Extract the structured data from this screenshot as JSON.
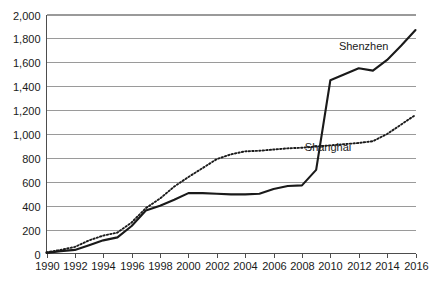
{
  "chart_data": {
    "type": "line",
    "title": "",
    "xlabel": "",
    "ylabel": "",
    "xlim": [
      1990,
      2016
    ],
    "ylim": [
      0,
      2000
    ],
    "grid": true,
    "legend_position": "inline-annotations",
    "x": [
      1990,
      1991,
      1992,
      1993,
      1994,
      1995,
      1996,
      1997,
      1998,
      1999,
      2000,
      2001,
      2002,
      2003,
      2004,
      2005,
      2006,
      2007,
      2008,
      2009,
      2010,
      2011,
      2012,
      2013,
      2014,
      2015,
      2016
    ],
    "xticks": [
      "1990",
      "1992",
      "1994",
      "1996",
      "1998",
      "2000",
      "2002",
      "2004",
      "2006",
      "2008",
      "2010",
      "2012",
      "2014",
      "2016"
    ],
    "yticks": [
      "0",
      "200",
      "400",
      "600",
      "800",
      "1,000",
      "1,200",
      "1,400",
      "1,600",
      "1,800",
      "2,000"
    ],
    "series": [
      {
        "name": "Shenzhen",
        "style": "solid",
        "color": "#1a1a1a",
        "label": "Shenzhen",
        "values": [
          5,
          20,
          30,
          70,
          110,
          135,
          230,
          360,
          400,
          450,
          505,
          505,
          500,
          495,
          495,
          500,
          540,
          565,
          570,
          700,
          1450,
          1500,
          1550,
          1530,
          1620,
          1740,
          1870
        ]
      },
      {
        "name": "Shanghai",
        "style": "dotted",
        "color": "#1a1a1a",
        "label": "Shanghai",
        "values": [
          10,
          30,
          55,
          110,
          150,
          175,
          260,
          380,
          460,
          560,
          640,
          715,
          790,
          830,
          855,
          860,
          870,
          880,
          885,
          895,
          905,
          915,
          925,
          940,
          1000,
          1080,
          1160
        ]
      }
    ],
    "annotations": [
      {
        "text": "Shenzhen",
        "x": 2010.6,
        "y": 1705
      },
      {
        "text": "Shanghai",
        "x": 2008.2,
        "y": 860
      }
    ]
  }
}
